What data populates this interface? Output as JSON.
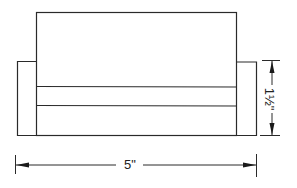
{
  "drawing": {
    "subject": "sofa front elevation",
    "dimensions": {
      "width_label": "5\"",
      "arm_height_label": "1½\""
    },
    "colors": {
      "line": "#2a2a2a",
      "background": "#ffffff"
    }
  }
}
